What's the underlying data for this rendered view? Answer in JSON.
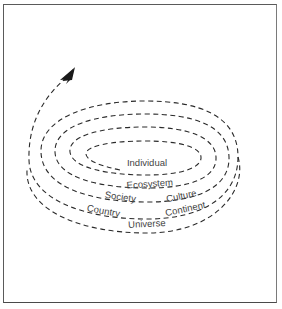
{
  "diagram": {
    "type": "spiral",
    "stroke_color": "#2a2a2a",
    "label_color": "#444444",
    "labels": {
      "individual": "Individual",
      "ecosystem": "Ecosystem",
      "society": "Society",
      "culture": "Culture",
      "country": "Country",
      "continent": "Continent",
      "universe": "Universe"
    },
    "arrow": "arrowhead-up-right"
  }
}
